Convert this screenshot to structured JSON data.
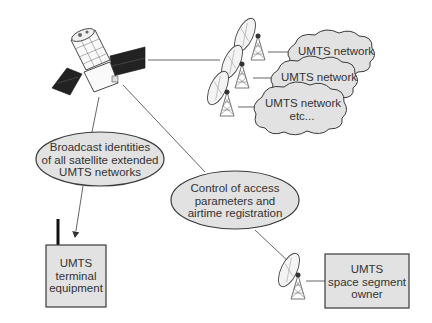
{
  "diagram": {
    "clouds": [
      {
        "id": "net1",
        "lines": [
          "UMTS network"
        ]
      },
      {
        "id": "net2",
        "lines": [
          "UMTS network"
        ]
      },
      {
        "id": "net3",
        "lines": [
          "UMTS network",
          "etc..."
        ]
      }
    ],
    "ellipses": [
      {
        "id": "broadcast",
        "lines": [
          "Broadcast identities",
          "of all satellite extended",
          "UMTS networks"
        ]
      },
      {
        "id": "control",
        "lines": [
          "Control of access",
          "parameters and",
          "airtime registration"
        ]
      }
    ],
    "boxes": [
      {
        "id": "terminal",
        "lines": [
          "UMTS",
          "terminal",
          "equipment"
        ]
      },
      {
        "id": "owner",
        "lines": [
          "UMTS",
          "space segment",
          "owner"
        ]
      }
    ],
    "colors": {
      "fill": "#e2e2e2",
      "stroke": "#3a3a3a",
      "line": "#555555",
      "panel": "#2a2a2a"
    }
  }
}
